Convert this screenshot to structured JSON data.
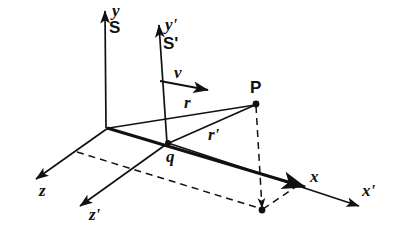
{
  "figure": {
    "background_color": "#ffffff",
    "line_color": "#111111",
    "axes": [
      {
        "key": "y",
        "label": "y",
        "style": "italic",
        "frame": "S"
      },
      {
        "key": "x",
        "label": "x",
        "style": "italic",
        "frame": "S"
      },
      {
        "key": "z",
        "label": "z",
        "style": "italic",
        "frame": "S"
      },
      {
        "key": "yprime",
        "label": "y'",
        "style": "italic",
        "frame": "S'"
      },
      {
        "key": "xprime",
        "label": "x'",
        "style": "italic",
        "frame": "S'"
      },
      {
        "key": "zprime",
        "label": "z'",
        "style": "italic",
        "frame": "S'"
      }
    ],
    "frames": [
      {
        "key": "S",
        "label": "S",
        "style": "upright"
      },
      {
        "key": "Sp",
        "label": "S'",
        "style": "upright"
      }
    ],
    "vectors": [
      {
        "key": "v",
        "label": "v",
        "style": "italic",
        "from": "S'-origin",
        "to": "right",
        "arrow": true
      },
      {
        "key": "r",
        "label": "r",
        "style": "italic",
        "from": "S-origin",
        "to": "P",
        "arrow": false
      },
      {
        "key": "rp",
        "label": "r'",
        "style": "italic",
        "from": "q",
        "to": "P",
        "arrow": false
      }
    ],
    "points": [
      {
        "key": "P",
        "label": "P",
        "style": "upright",
        "x": 256,
        "y": 104
      },
      {
        "key": "q",
        "label": "q",
        "style": "italic",
        "x": 168,
        "y": 143
      },
      {
        "key": "Pproj",
        "label": "",
        "style": "upright",
        "x": 262,
        "y": 210
      }
    ]
  }
}
